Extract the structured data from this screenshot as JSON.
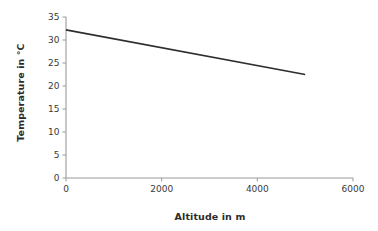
{
  "chart_data": {
    "type": "line",
    "title": "",
    "subtitle": "",
    "xlabel": "Altitude in m",
    "ylabel": "Temperature in °C",
    "xlim": [
      0,
      6000
    ],
    "ylim": [
      0,
      35
    ],
    "grid": false,
    "legend": null,
    "legend_position": "none",
    "x_ticks": [
      0,
      2000,
      4000,
      6000
    ],
    "x_tick_labels": [
      "0",
      "2000",
      "4000",
      "6000"
    ],
    "y_ticks": [
      0,
      5,
      10,
      15,
      20,
      25,
      30,
      35
    ],
    "y_tick_labels": [
      "0",
      "5",
      "10",
      "15",
      "20",
      "25",
      "30",
      "35"
    ],
    "series": [
      {
        "name": "Temperature",
        "color": "#2e2e2e",
        "x": [
          0,
          5000
        ],
        "values": [
          32.2,
          22.5
        ]
      }
    ],
    "annotations": []
  },
  "axis_color": "#9a9a9a",
  "background_color": "#ffffff",
  "tick_label_color": "#3a3a3a",
  "axis_title_color": "#2b2b2b"
}
